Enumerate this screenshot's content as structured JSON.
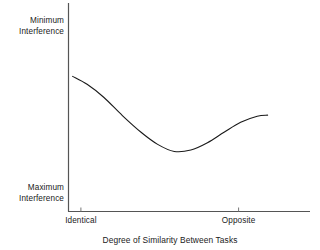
{
  "chart_data": {
    "type": "line",
    "title": "",
    "xlabel": "Degree of Similarity Between Tasks",
    "ylabel": "",
    "y_axis_annotations": {
      "top": "Minimum Interference",
      "top_line1": "Minimum",
      "top_line2": "Interference",
      "bottom": "Maximum Interference",
      "bottom_line1": "Maximum",
      "bottom_line2": "Interference"
    },
    "x_tick_labels": [
      "Identical",
      "Opposite"
    ],
    "x_tick_positions": [
      0.05,
      0.81
    ],
    "xlim": [
      0,
      1
    ],
    "ylim": [
      0,
      1
    ],
    "grid": false,
    "legend": null,
    "series": [
      {
        "name": "interference",
        "comment": "U-shaped curve: high-ish at Identical, dips to maximum interference mid-scale, rises toward Opposite",
        "x": [
          0.01,
          0.08,
          0.16,
          0.25,
          0.34,
          0.42,
          0.5,
          0.58,
          0.66,
          0.74,
          0.82,
          0.9,
          0.95
        ],
        "y": [
          0.648,
          0.61,
          0.548,
          0.46,
          0.38,
          0.322,
          0.288,
          0.295,
          0.33,
          0.38,
          0.428,
          0.457,
          0.462
        ]
      }
    ],
    "line_color": "#1a1a1a",
    "line_width": 1.1,
    "axis_color": "#4a4a4a",
    "background": "#ffffff"
  }
}
